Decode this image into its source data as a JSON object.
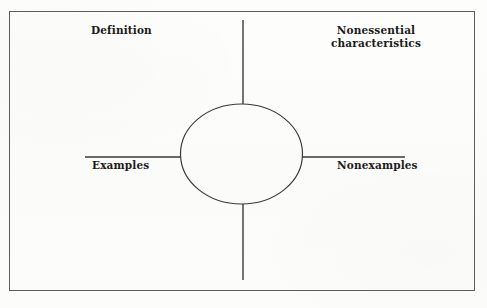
{
  "diagram": {
    "type": "frayer-model",
    "background_color": "#fcfcfa",
    "ink_color": "#2a2a2a",
    "border_color": "#5d5d5d",
    "quadrants": {
      "top_left": {
        "label": "Definition"
      },
      "top_right": {
        "label_line1": "Nonessential",
        "label_line2": "characteristics"
      },
      "bottom_left": {
        "label": "Examples"
      },
      "bottom_right": {
        "label": "Nonexamples"
      }
    },
    "center_shape": {
      "name": "ellipse",
      "cx": 241.5,
      "cy": 154,
      "rx": 61,
      "ry": 50
    },
    "axes": {
      "vertical_x": 243,
      "vertical_top_y": 20,
      "vertical_bottom_y": 280,
      "horizontal_y": 157,
      "horizontal_left_x": 85,
      "horizontal_right_x": 405
    },
    "frame": {
      "x": 9,
      "y": 11,
      "width": 466,
      "height": 280
    }
  }
}
